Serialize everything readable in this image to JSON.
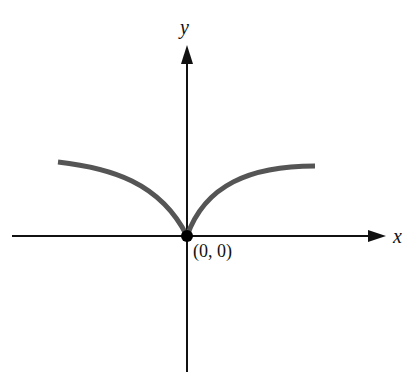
{
  "diagram": {
    "type": "graph-of-function",
    "axes": {
      "x_label": "x",
      "y_label": "y"
    },
    "point": {
      "label": "(0, 0)",
      "x": 0,
      "y": 0
    },
    "curve": {
      "description": "cusp at origin, symmetric, concave down on both sides, leveling off",
      "color": "#555555"
    },
    "colors": {
      "axis": "#111111",
      "curve": "#555555",
      "point": "#000000"
    }
  }
}
